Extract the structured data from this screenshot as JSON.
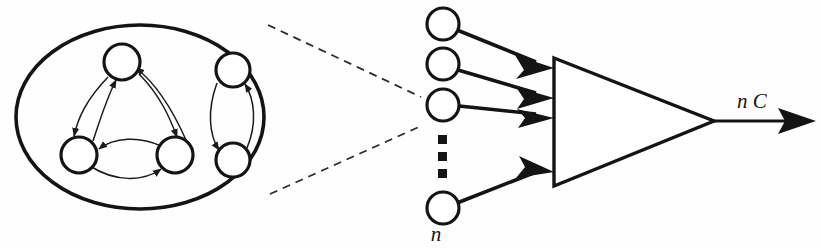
{
  "figure": {
    "background_color": "#fefefe",
    "ink_color": "#141414",
    "labels": {
      "input_count": "n",
      "output": "n C"
    },
    "group": {
      "name": "recurrent-network-cluster",
      "shape": "ellipse",
      "center": [
        140,
        117
      ],
      "radius_x": 124,
      "radius_y": 92,
      "node_count": 5,
      "nodes": [
        {
          "id": "t1",
          "cx": 122,
          "cy": 62,
          "r": 18
        },
        {
          "id": "t2",
          "cx": 79,
          "cy": 155,
          "r": 18
        },
        {
          "id": "t3",
          "cx": 175,
          "cy": 155,
          "r": 18
        },
        {
          "id": "p1",
          "cx": 233,
          "cy": 70,
          "r": 17
        },
        {
          "id": "p2",
          "cx": 233,
          "cy": 160,
          "r": 17
        }
      ],
      "edges": [
        {
          "from": "t1",
          "to": "t2"
        },
        {
          "from": "t2",
          "to": "t1"
        },
        {
          "from": "t1",
          "to": "t3"
        },
        {
          "from": "t3",
          "to": "t1"
        },
        {
          "from": "t2",
          "to": "t3"
        },
        {
          "from": "t3",
          "to": "t2"
        },
        {
          "from": "p1",
          "to": "p2"
        },
        {
          "from": "p2",
          "to": "p1"
        }
      ]
    },
    "callout": {
      "name": "magnification-callout",
      "style": "dashed",
      "upper_line": [
        [
          268,
          25
        ],
        [
          421,
          97
        ]
      ],
      "lower_line": [
        [
          270,
          194
        ],
        [
          421,
          126
        ]
      ]
    },
    "inputs": {
      "name": "input-terminal-column",
      "circle_radius": 16,
      "circles": [
        {
          "cx": 443,
          "cy": 24
        },
        {
          "cx": 443,
          "cy": 64
        },
        {
          "cx": 443,
          "cy": 105
        },
        {
          "cx": 443,
          "cy": 208
        }
      ],
      "ellipsis_dots": [
        {
          "cx": 443,
          "cy": 140
        },
        {
          "cx": 443,
          "cy": 157
        },
        {
          "cx": 443,
          "cy": 174
        }
      ],
      "label_position": [
        436,
        240
      ]
    },
    "amplifier": {
      "name": "amplifier-triangle",
      "apex_top": [
        554,
        58
      ],
      "apex_bottom": [
        554,
        186
      ],
      "tip_right": [
        714,
        121
      ]
    },
    "output": {
      "name": "output-arrow",
      "from": [
        714,
        121
      ],
      "to": [
        815,
        121
      ],
      "label_position": [
        737,
        108
      ]
    }
  }
}
